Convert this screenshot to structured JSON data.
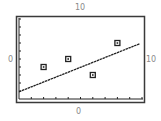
{
  "labels": {
    "top": "10",
    "bottom": "0",
    "left": "0",
    "right": "10"
  },
  "chart_data": {
    "type": "scatter",
    "title": "",
    "xlabel": "",
    "ylabel": "",
    "xlim": [
      0,
      10
    ],
    "ylim": [
      0,
      10
    ],
    "x_ticks": 10,
    "y_ticks": 10,
    "grid": false,
    "series": [
      {
        "name": "data points",
        "marker": "square",
        "points": [
          [
            2,
            4
          ],
          [
            4,
            5
          ],
          [
            6,
            3
          ],
          [
            8,
            7
          ]
        ]
      },
      {
        "name": "fit line",
        "type": "line",
        "points": [
          [
            0,
            0.9
          ],
          [
            9.8,
            6.9
          ]
        ]
      }
    ],
    "window_labels": {
      "xmin": "0",
      "xmax": "10",
      "ymin": "0",
      "ymax": "10"
    }
  },
  "colors": {
    "frame": "#3a3a3a",
    "ink": "#222222",
    "label": "#8a8a8a"
  }
}
